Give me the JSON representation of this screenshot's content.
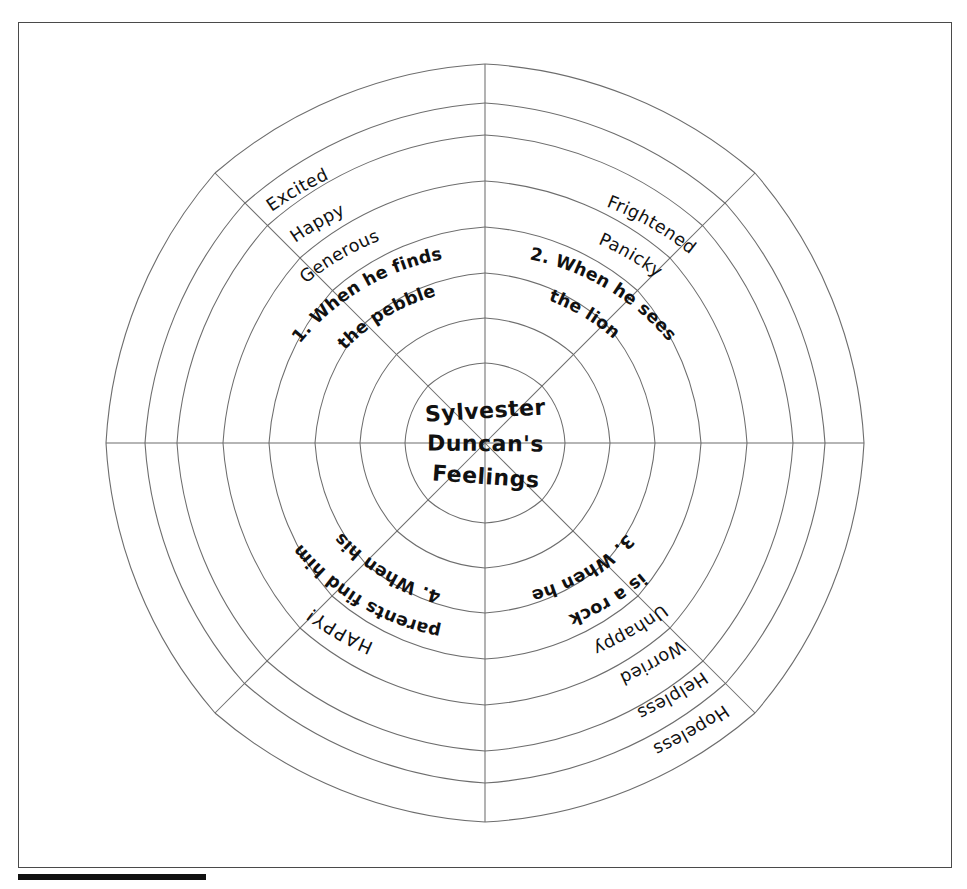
{
  "document": {
    "title": "Sylvester Duncan's Feelings",
    "type": "spider-web graphic organizer",
    "center_lines": [
      "Sylvester",
      "Duncan's",
      "Feelings"
    ]
  },
  "center": {
    "line1": "Sylvester",
    "line2": "Duncan's",
    "line3": "Feelings"
  },
  "sectors": [
    {
      "id": "sector-1",
      "position": "upper-left",
      "question": "1. When he finds the pebble",
      "question_line1": "1. When he finds",
      "question_line2": "the pebble",
      "feelings": [
        "Generous",
        "Happy",
        "Excited"
      ]
    },
    {
      "id": "sector-2",
      "position": "upper-right",
      "question": "2. When he sees the lion",
      "question_line1": "2. When he sees",
      "question_line2": "the lion",
      "feelings": [
        "Panicky",
        "Frightened"
      ]
    },
    {
      "id": "sector-3",
      "position": "lower-right",
      "question": "3. When he is a rock",
      "question_line1": "3. When he",
      "question_line2": "is a rock",
      "feelings": [
        "Unhappy",
        "Worried",
        "Helpless",
        "Hopeless"
      ]
    },
    {
      "id": "sector-4",
      "position": "lower-left",
      "question": "4. When his parents find him",
      "question_line1": "4. When his",
      "question_line2": "parents find him",
      "feelings": [
        "HAPPY!"
      ]
    }
  ],
  "colors": {
    "line": "#6d6d6d",
    "text": "#111111",
    "border": "#4a4a4a",
    "rule": "#111111",
    "background": "#ffffff"
  },
  "geometry": {
    "center_x": 485,
    "center_y": 443,
    "spokes": 8,
    "rings": 8
  }
}
